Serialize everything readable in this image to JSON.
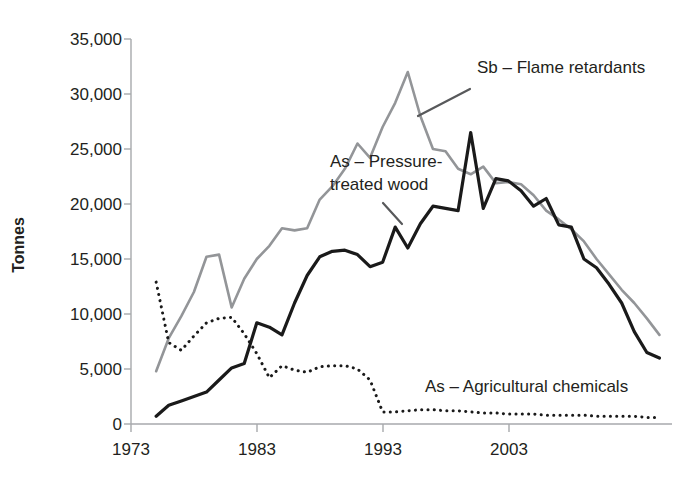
{
  "chart_data": {
    "type": "line",
    "title": "",
    "xlabel": "",
    "ylabel": "Tonnes",
    "xlim": [
      1973,
      2016
    ],
    "ylim": [
      0,
      35000
    ],
    "grid": false,
    "legend_position": "inline-annotations",
    "y_ticks": [
      0,
      5000,
      10000,
      15000,
      20000,
      25000,
      30000,
      35000
    ],
    "y_tick_labels": [
      "0",
      "5,000",
      "10,000",
      "15,000",
      "20,000",
      "25,000",
      "30,000",
      "35,000"
    ],
    "x_ticks": [
      1973,
      1983,
      1993,
      2003
    ],
    "x_tick_labels": [
      "1973",
      "1983",
      "1993",
      "2003"
    ],
    "series": [
      {
        "name": "Sb – Flame retardants",
        "style": "solid",
        "color": "#939598",
        "x": [
          1975,
          1976,
          1977,
          1978,
          1979,
          1980,
          1981,
          1982,
          1983,
          1984,
          1985,
          1986,
          1987,
          1988,
          1989,
          1990,
          1991,
          1992,
          1993,
          1994,
          1995,
          1996,
          1997,
          1998,
          1999,
          2000,
          2001,
          2002,
          2003,
          2004,
          2005,
          2006,
          2007,
          2008,
          2009,
          2010,
          2011,
          2012,
          2013,
          2014,
          2015
        ],
        "y": [
          4800,
          7800,
          9800,
          12000,
          15200,
          15400,
          10600,
          13200,
          15000,
          16200,
          17800,
          17600,
          17800,
          20400,
          21600,
          23200,
          25500,
          24200,
          27000,
          29200,
          32000,
          28000,
          25000,
          24800,
          23200,
          22700,
          23400,
          21900,
          22000,
          21800,
          20800,
          19400,
          18600,
          17700,
          16600,
          15000,
          13600,
          12200,
          11000,
          9600,
          8100
        ]
      },
      {
        "name": "As – Pressure-treated wood",
        "style": "solid",
        "color": "#1a1a1a",
        "x": [
          1975,
          1976,
          1977,
          1978,
          1979,
          1980,
          1981,
          1982,
          1983,
          1984,
          1985,
          1986,
          1987,
          1988,
          1989,
          1990,
          1991,
          1992,
          1993,
          1994,
          1995,
          1996,
          1997,
          1998,
          1999,
          2000,
          2001,
          2002,
          2003,
          2004,
          2005,
          2006,
          2007,
          2008,
          2009,
          2010,
          2011,
          2012,
          2013,
          2014,
          2015
        ],
        "y": [
          700,
          1700,
          2100,
          2500,
          2900,
          4000,
          5100,
          5500,
          9200,
          8800,
          8100,
          11000,
          13500,
          15200,
          15700,
          15800,
          15400,
          14300,
          14700,
          17900,
          16000,
          18200,
          19800,
          19600,
          19400,
          26500,
          19600,
          22300,
          22100,
          21200,
          19800,
          20500,
          18100,
          17900,
          15000,
          14200,
          12700,
          11000,
          8400,
          6500,
          6000
        ]
      },
      {
        "name": "As – Agricultural chemicals",
        "style": "dotted",
        "color": "#1a1a1a",
        "x": [
          1975,
          1976,
          1977,
          1978,
          1979,
          1980,
          1981,
          1982,
          1983,
          1984,
          1985,
          1986,
          1987,
          1988,
          1989,
          1990,
          1991,
          1992,
          1993,
          1994,
          1995,
          1996,
          1997,
          1998,
          1999,
          2000,
          2001,
          2002,
          2003,
          2004,
          2005,
          2006,
          2007,
          2008,
          2009,
          2010,
          2011,
          2012,
          2013,
          2014,
          2015
        ],
        "y": [
          12900,
          7400,
          6700,
          8000,
          9200,
          9600,
          9700,
          8200,
          6400,
          4200,
          5300,
          4900,
          4700,
          5200,
          5300,
          5300,
          5000,
          4000,
          1100,
          1100,
          1200,
          1300,
          1300,
          1200,
          1200,
          1100,
          1000,
          1000,
          900,
          900,
          900,
          800,
          800,
          800,
          800,
          700,
          700,
          700,
          700,
          600,
          600
        ]
      }
    ],
    "annotations": [
      {
        "text": "Sb – Flame retardants",
        "series": "Sb – Flame retardants"
      },
      {
        "text": "As – Pressure-",
        "series": "As – Pressure-treated wood"
      },
      {
        "text": "treated wood",
        "series": "As – Pressure-treated wood"
      },
      {
        "text": "As – Agricultural chemicals",
        "series": "As – Agricultural chemicals"
      }
    ]
  },
  "axis": {
    "y_title": "Tonnes",
    "y_tick_labels": [
      "35,000",
      "30,000",
      "25,000",
      "20,000",
      "15,000",
      "10,000",
      "5,000",
      "0"
    ],
    "x_tick_labels": [
      "1973",
      "1983",
      "1993",
      "2003"
    ]
  },
  "annotations": {
    "sb_label": "Sb – Flame retardants",
    "wood_label_line1": "As – Pressure-",
    "wood_label_line2": "treated wood",
    "agri_label": "As – Agricultural chemicals"
  },
  "colors": {
    "sb_line": "#939598",
    "wood_line": "#1a1a1a",
    "agri_line": "#1a1a1a",
    "axis": "#a7a9ac",
    "text": "#231f20",
    "background": "#ffffff"
  }
}
